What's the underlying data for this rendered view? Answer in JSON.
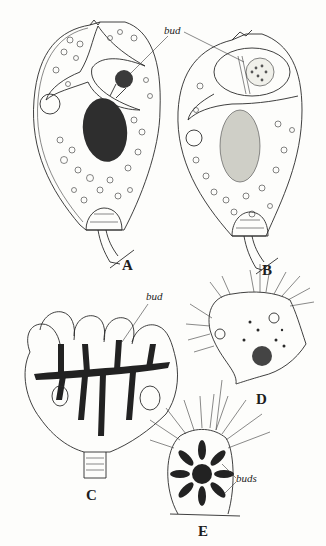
{
  "figure": {
    "panels": [
      {
        "id": "A",
        "label": "A",
        "annotation": "bud"
      },
      {
        "id": "B",
        "label": "B",
        "annotation": ""
      },
      {
        "id": "C",
        "label": "C",
        "annotation": "bud"
      },
      {
        "id": "D",
        "label": "D",
        "annotation": ""
      },
      {
        "id": "E",
        "label": "E",
        "annotation": "buds"
      }
    ],
    "shared_annotation_AB": "bud"
  }
}
